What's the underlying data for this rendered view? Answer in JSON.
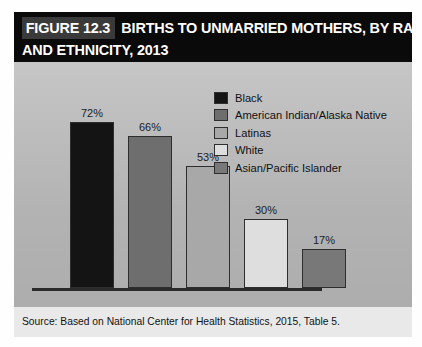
{
  "figure": {
    "tag": "FIGURE 12.3",
    "title_line_1": "BIRTHS TO UNMARRIED MOTHERS, BY RACE",
    "title_line_2": "AND ETHNICITY, 2013"
  },
  "source": {
    "text": "Source: Based on National Center for Health Statistics, 2015, Table 5."
  },
  "legend": {
    "items": [
      {
        "label": "Black",
        "color": "#141414"
      },
      {
        "label": "American Indian/Alaska Native",
        "color": "#6e6e6e"
      },
      {
        "label": "Latinas",
        "color": "#a8a8a8"
      },
      {
        "label": "White",
        "color": "#dedede"
      },
      {
        "label": "Asian/Pacific Islander",
        "color": "#787878"
      }
    ]
  },
  "chart_data": {
    "type": "bar",
    "xlabel": "",
    "ylabel": "",
    "ylim": [
      0,
      80
    ],
    "grid": false,
    "legend_position": "top-right",
    "categories": [
      "Black",
      "American Indian/Alaska Native",
      "Latinas",
      "White",
      "Asian/Pacific Islander"
    ],
    "values": [
      72,
      66,
      53,
      30,
      17
    ],
    "data_labels": [
      "72%",
      "66%",
      "53%",
      "30%",
      "17%"
    ],
    "colors": [
      "#141414",
      "#6e6e6e",
      "#a8a8a8",
      "#dedede",
      "#787878"
    ],
    "source": "Source: Based on National Center for Health Statistics, 2015, Table 5."
  }
}
